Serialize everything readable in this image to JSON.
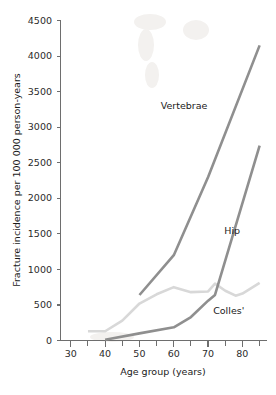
{
  "chart_data": {
    "type": "line",
    "title": "",
    "xlabel": "Age group (years)",
    "ylabel": "Fracture incidence per 100 000 person-years",
    "xlim": [
      27,
      87
    ],
    "ylim": [
      0,
      4500
    ],
    "grid": false,
    "legend_position": "inline-annotations",
    "x_major_ticks": [
      30,
      40,
      50,
      60,
      70,
      80
    ],
    "x_minor_ticks": [
      35,
      45,
      55,
      65,
      75,
      85
    ],
    "y_major_ticks": [
      0,
      500,
      1000,
      1500,
      2000,
      2500,
      3000,
      3500,
      4000,
      4500
    ],
    "series": [
      {
        "name": "Vertebrae",
        "color": "#8f8f8f",
        "x": [
          50,
          60,
          70,
          85
        ],
        "values": [
          640,
          1200,
          2300,
          4150
        ],
        "label_x": 63,
        "label_y": 3250
      },
      {
        "name": "Hip",
        "color": "#8f8f8f",
        "x": [
          40,
          50,
          60,
          65,
          70,
          72,
          85
        ],
        "values": [
          10,
          100,
          185,
          330,
          560,
          640,
          2740
        ],
        "label_x": 77,
        "label_y": 1500
      },
      {
        "name": "Colles'",
        "color": "#d8d8d8",
        "x": [
          35,
          40,
          45,
          50,
          55,
          60,
          65,
          70,
          72,
          75,
          78,
          80,
          85
        ],
        "values": [
          130,
          130,
          280,
          520,
          650,
          750,
          680,
          690,
          800,
          700,
          630,
          660,
          810
        ],
        "label_x": 76,
        "label_y": 370
      }
    ]
  },
  "axes": {
    "y_tick_labels": [
      "0",
      "500",
      "1000",
      "1500",
      "2000",
      "2500",
      "3000",
      "3500",
      "4000",
      "4500"
    ],
    "x_tick_labels": [
      "30",
      "40",
      "50",
      "60",
      "70",
      "80"
    ],
    "x_title": "Age group (years)",
    "y_title": "Fracture incidence per 100 000 person-years"
  },
  "annotations": {
    "vertebrae_label": "Vertebrae",
    "hip_label": "Hip",
    "colles_label": "Colles'"
  },
  "colors": {
    "line_dark": "#8f8f8f",
    "line_light": "#d8d8d8",
    "axis": "#6e6e6e",
    "text": "#1a1a1a",
    "background": "#ffffff"
  }
}
